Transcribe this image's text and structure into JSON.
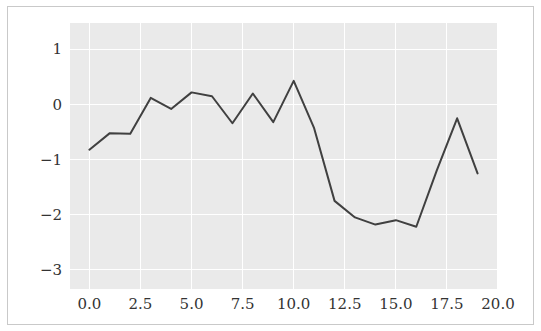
{
  "chart_data": {
    "type": "line",
    "title": "",
    "xlabel": "",
    "ylabel": "",
    "xlim": [
      -0.95,
      20.0
    ],
    "ylim": [
      -3.35,
      1.48
    ],
    "xticks": [
      0.0,
      2.5,
      5.0,
      7.5,
      10.0,
      12.5,
      15.0,
      17.5,
      20.0
    ],
    "xtick_labels": [
      "0.0",
      "2.5",
      "5.0",
      "7.5",
      "10.0",
      "12.5",
      "15.0",
      "17.5",
      "20.0"
    ],
    "yticks": [
      1,
      0,
      -1,
      -2,
      -3
    ],
    "ytick_labels": [
      "1",
      "0",
      "−1",
      "−2",
      "−3"
    ],
    "grid": true,
    "grid_color": "#ffffff",
    "plot_bgcolor": "#eaeaea",
    "figure_bgcolor": "#ffffff",
    "line_color": "#404040",
    "legend": null,
    "x": [
      0,
      1,
      2,
      3,
      4,
      5,
      6,
      7,
      8,
      9,
      10,
      11,
      12,
      13,
      14,
      15,
      16,
      17,
      18,
      19
    ],
    "values": [
      -0.82,
      -0.52,
      -0.53,
      0.12,
      -0.08,
      0.22,
      0.15,
      -0.34,
      0.2,
      -0.32,
      0.43,
      -0.43,
      -1.75,
      -2.05,
      -2.18,
      -2.1,
      -2.22,
      -1.2,
      -0.25,
      -1.25
    ],
    "series": [
      {
        "name": "series-1",
        "color": "#404040",
        "values": [
          -0.82,
          -0.52,
          -0.53,
          0.12,
          -0.08,
          0.22,
          0.15,
          -0.34,
          0.2,
          -0.32,
          0.43,
          -0.43,
          -1.75,
          -2.05,
          -2.18,
          -2.1,
          -2.22,
          -1.2,
          -0.25,
          -1.25
        ]
      }
    ]
  }
}
